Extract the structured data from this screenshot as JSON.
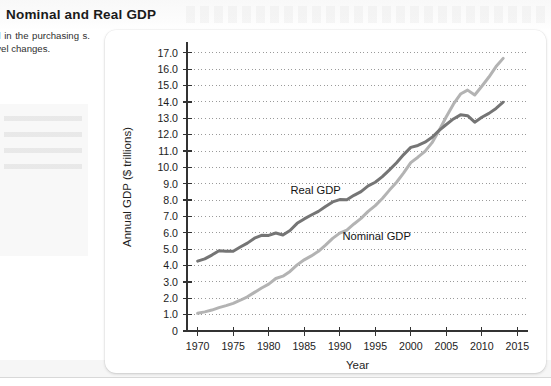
{
  "exhibit": {
    "title": "Nominal and Real GDP",
    "caption_text": "minal and real GDP. d in the purchasing s. The gap between e level changes.",
    "caption_source": "ommerce."
  },
  "chart_data": {
    "type": "line",
    "title": "",
    "xlabel": "Year",
    "ylabel": "Annual GDP ($ trillions)",
    "xlim": [
      1968.5,
      2016.5
    ],
    "ylim": [
      0,
      17.6
    ],
    "xticks": [
      1970,
      1975,
      1980,
      1985,
      1990,
      1995,
      2000,
      2005,
      2010,
      2015
    ],
    "xtick_labels": [
      "1970",
      "1975",
      "1980",
      "1985",
      "1990",
      "1995",
      "2000",
      "2005",
      "2010",
      "2015"
    ],
    "yticks": [
      0,
      1,
      2,
      3,
      4,
      5,
      6,
      7,
      8,
      9,
      10,
      11,
      12,
      13,
      14,
      15,
      16,
      17
    ],
    "ytick_labels": [
      "0",
      "1.0",
      "2.0",
      "3.0",
      "4.0",
      "5.0",
      "6.0",
      "7.0",
      "8.0",
      "9.0",
      "10.0",
      "11.0",
      "12.0",
      "13.0",
      "14.0",
      "15.0",
      "16.0",
      "17.0"
    ],
    "grid": "horizontal-dotted",
    "legend": "inline-annotations",
    "x": [
      1970,
      1971,
      1972,
      1973,
      1974,
      1975,
      1976,
      1977,
      1978,
      1979,
      1980,
      1981,
      1982,
      1983,
      1984,
      1985,
      1986,
      1987,
      1988,
      1989,
      1990,
      1991,
      1992,
      1993,
      1994,
      1995,
      1996,
      1997,
      1998,
      1999,
      2000,
      2001,
      2002,
      2003,
      2004,
      2005,
      2006,
      2007,
      2008,
      2009,
      2010,
      2011,
      2012,
      2013
    ],
    "series": [
      {
        "name": "Real GDP",
        "color": "#757575",
        "width": 3.0,
        "label_x": 1986.6,
        "label_y": 8.35,
        "values": [
          4.27,
          4.41,
          4.64,
          4.91,
          4.88,
          4.87,
          5.13,
          5.37,
          5.67,
          5.85,
          5.84,
          5.99,
          5.87,
          6.14,
          6.58,
          6.85,
          7.09,
          7.31,
          7.61,
          7.89,
          8.03,
          8.02,
          8.29,
          8.52,
          8.87,
          9.09,
          9.43,
          9.85,
          10.28,
          10.78,
          11.22,
          11.34,
          11.54,
          11.84,
          12.26,
          12.62,
          12.96,
          13.21,
          13.16,
          12.76,
          13.06,
          13.3,
          13.6,
          13.98
        ]
      },
      {
        "name": "Nominal GDP",
        "color": "#b3b3b3",
        "width": 3.0,
        "label_x": 1995.2,
        "label_y": 5.55,
        "values": [
          1.08,
          1.17,
          1.28,
          1.43,
          1.55,
          1.69,
          1.88,
          2.09,
          2.36,
          2.63,
          2.86,
          3.21,
          3.35,
          3.64,
          4.04,
          4.35,
          4.59,
          4.87,
          5.25,
          5.66,
          5.98,
          6.17,
          6.54,
          6.88,
          7.31,
          7.66,
          8.1,
          8.61,
          9.09,
          9.66,
          10.29,
          10.62,
          10.98,
          11.51,
          12.27,
          13.09,
          13.86,
          14.48,
          14.72,
          14.42,
          14.96,
          15.52,
          16.16,
          16.66
        ]
      }
    ]
  }
}
